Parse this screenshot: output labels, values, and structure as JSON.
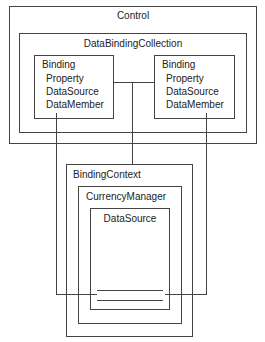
{
  "diagram": {
    "control": {
      "label": "Control"
    },
    "collection": {
      "label": "DataBindingCollection"
    },
    "bindings": [
      {
        "title": "Binding",
        "props": [
          "Property",
          "DataSource",
          "DataMember"
        ]
      },
      {
        "title": "Binding",
        "props": [
          "Property",
          "DataSource",
          "DataMember"
        ]
      }
    ],
    "context": {
      "label": "BindingContext"
    },
    "manager": {
      "label": "CurrencyManager"
    },
    "datasource": {
      "label": "DataSource"
    },
    "colors": {
      "line": "#444444",
      "background": "#ffffff",
      "text": "#222222"
    }
  }
}
